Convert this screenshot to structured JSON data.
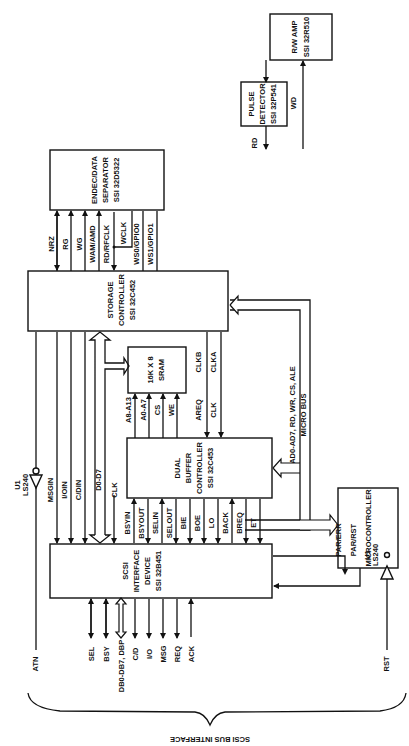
{
  "blocks": {
    "rw_amp": [
      "R/W AMP",
      "SSI 32R510"
    ],
    "pulse_detector": [
      "PULSE",
      "DETECTOR",
      "SSI 32P541"
    ],
    "endec": [
      "ENDEC/DATA",
      "SEPARATOR",
      "SSI 32D5322"
    ],
    "storage": [
      "STORAGE",
      "CONTROLLER",
      "SSI 32C452"
    ],
    "sram": [
      "16K X 8",
      "SRAM"
    ],
    "dual_buffer": [
      "DUAL",
      "BUFFER",
      "CONTROLLER",
      "SSI 32C453"
    ],
    "scsi": [
      "SCSI",
      "INTERFACE",
      "DEVICE",
      "SSI 32B451"
    ],
    "micro": [
      "MICROCONTROLLER"
    ]
  },
  "signals": {
    "rd": "RD",
    "wd": "WD",
    "nrz": "NRZ",
    "rg": "RG",
    "wg": "WG",
    "wam": "WAM/AMD",
    "rdrf": "RD/RFCLK",
    "wclk": "WCLK",
    "ws0": "WS0/GPIO0",
    "ws1": "WS1/GPIO1",
    "msgin": "MSGIN",
    "ioin": "I/OIN",
    "cdin": "C/DIN",
    "d0d7": "D0-D7",
    "clk": "CLK",
    "a8a13": "A8-A13",
    "a0a7": "A0-A7",
    "cs": "CS",
    "we": "WE",
    "areq": "AREQ",
    "clk2": "CLK",
    "clkb": "CLKB",
    "clka": "CLKA",
    "bsyin": "BSYIN",
    "bsyout": "BSYOUT",
    "selin": "SELIN",
    "selout": "SELOUT",
    "bie": "BIE",
    "boe": "BOE",
    "lo": "LO",
    "back": "BACK",
    "breq": "BREQ",
    "et": "ET",
    "parerr": "PAR/ERR",
    "parrst": "PAR/RST",
    "microbus1": "AD0-AD7, RD, WR, CS, ALE",
    "microbus2": "MICRO BUS",
    "atn": "ATN",
    "rst": "RST",
    "sel": "SEL",
    "bsy": "BSY",
    "db": "DB0-DB7, DBP",
    "cd": "C/D",
    "io": "I/O",
    "msg": "MSG",
    "req": "REQ",
    "ack": "ACK",
    "u1a": "U1",
    "ls240a": "LS240",
    "u1b": "U1",
    "ls240b": "LS240"
  },
  "footer": {
    "brace_label": "SCSI BUS INTERFACE"
  }
}
